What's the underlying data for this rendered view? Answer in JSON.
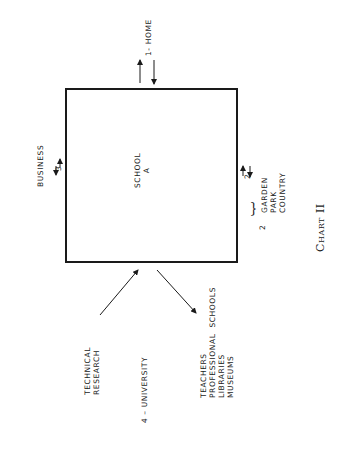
{
  "diagram": {
    "center": {
      "line1": "SCHOOL",
      "line2": "A"
    },
    "home": {
      "label": "1- HOME"
    },
    "business": {
      "label": "BUSINESS",
      "number": "3"
    },
    "outdoor": {
      "arrow_number": "2",
      "group_number": "2",
      "items": [
        "GARDEN",
        "PARK",
        "COUNTRY"
      ]
    },
    "university": {
      "label": "4 – UNIVERSITY",
      "inbound": [
        "TECHNICAL",
        "RESEARCH"
      ],
      "outbound_lines": [
        "TEACHERS",
        "PROFESSIONAL  SCHOOLS",
        "LIBRARIES",
        "MUSEUMS"
      ]
    },
    "caption": {
      "word": "Chart",
      "numeral": "II"
    }
  }
}
